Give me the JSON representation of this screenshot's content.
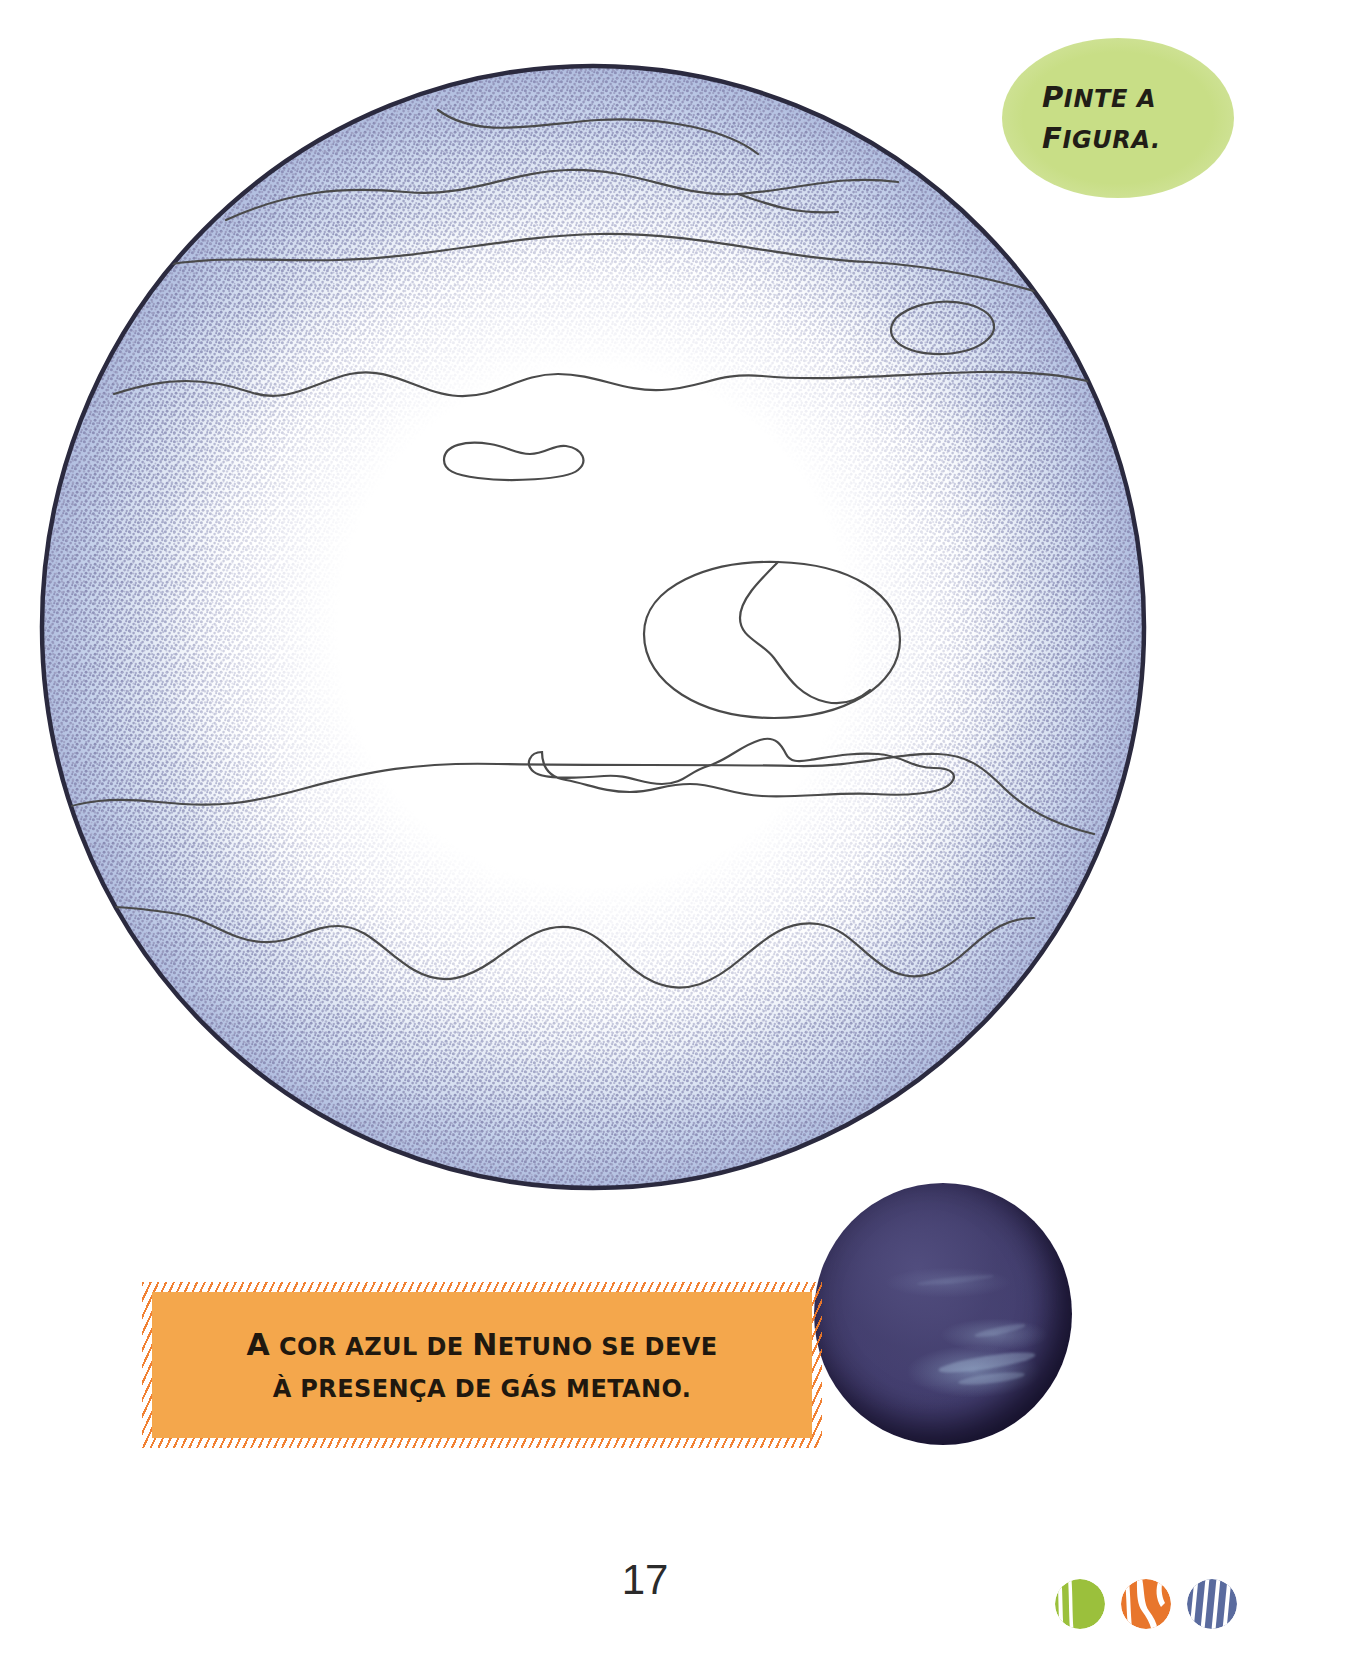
{
  "page": {
    "number": "17",
    "background_color": "#ffffff"
  },
  "instruction_badge": {
    "name": "pinte-a-figura",
    "lines": [
      "Pinte a",
      "figura."
    ],
    "line1_cap": "P",
    "line1_rest": "INTE A",
    "line2_cap": "F",
    "line2_rest": "IGURA.",
    "background_color": "#c8de86",
    "text_color": "#211d17"
  },
  "coloring_figure": {
    "name": "neptune-outline-drawing",
    "subject": "Netuno",
    "outline_color": "#2b2a3f",
    "stipple_color": "#8d90b8",
    "band_line_color": "#4a4a4a",
    "fill_color": "#ffffff"
  },
  "neptune_photo": {
    "name": "neptune-photograph",
    "base_color": "#423d6e",
    "shadow_color": "#16112a",
    "highlight_color": "#bad6eb"
  },
  "fact_box": {
    "name": "neptune-fact",
    "lines": [
      "A cor azul de Netuno se deve",
      "à presença de gás metano."
    ],
    "line1_cap": "A",
    "line1_mid": " COR AZUL DE ",
    "line1_cap2": "N",
    "line1_rest": "ETUNO SE DEVE",
    "line2": "À PRESENÇA DE GÁS METANO.",
    "background_color": "#f4a74c",
    "fringe_color": "#f07a28",
    "text_color": "#20180f"
  },
  "publisher_logo": {
    "name": "publisher-logo",
    "marks": [
      {
        "label": "green-brush-circle",
        "color": "#9bc03c"
      },
      {
        "label": "orange-brush-circle",
        "color": "#e8762c"
      },
      {
        "label": "blue-brush-circle",
        "color": "#5a6b9e"
      }
    ]
  }
}
